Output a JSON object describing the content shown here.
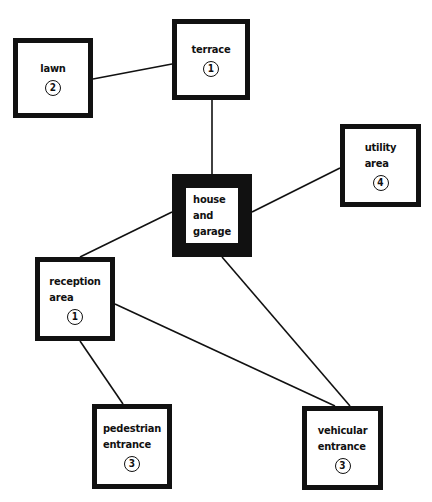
{
  "diagram": {
    "type": "bubble/adjacency diagram",
    "nodes": [
      {
        "id": "lawn",
        "label": [
          "lawn"
        ],
        "number": "2",
        "box": [
          13,
          38,
          80,
          80
        ],
        "border": 5
      },
      {
        "id": "terrace",
        "label": [
          "terrace"
        ],
        "number": "1",
        "box": [
          172,
          19,
          78,
          81
        ],
        "border": 5
      },
      {
        "id": "utility",
        "label": [
          "utility",
          "area"
        ],
        "number": "4",
        "box": [
          340,
          124,
          81,
          83
        ],
        "border": 5
      },
      {
        "id": "house",
        "label": [
          "house",
          "and",
          "garage"
        ],
        "number": null,
        "box": [
          172,
          174,
          80,
          83
        ],
        "border": 14
      },
      {
        "id": "reception",
        "label": [
          "reception",
          "area"
        ],
        "number": "1",
        "box": [
          35,
          257,
          80,
          84
        ],
        "border": 5
      },
      {
        "id": "pedestrian",
        "label": [
          "pedestrian",
          "entrance"
        ],
        "number": "3",
        "box": [
          92,
          404,
          80,
          85
        ],
        "border": 5
      },
      {
        "id": "vehicular",
        "label": [
          "vehicular",
          "entrance"
        ],
        "number": "3",
        "box": [
          302,
          406,
          81,
          84
        ],
        "border": 5
      }
    ],
    "edges": [
      {
        "from": "lawn",
        "to": "terrace",
        "line": [
          93,
          79,
          172,
          64
        ]
      },
      {
        "from": "terrace",
        "to": "house",
        "line": [
          212,
          100,
          212,
          174
        ]
      },
      {
        "from": "house",
        "to": "utility",
        "line": [
          252,
          212,
          340,
          168
        ]
      },
      {
        "from": "house",
        "to": "reception",
        "line": [
          172,
          212,
          80,
          257
        ]
      },
      {
        "from": "house",
        "to": "vehicular",
        "line": [
          222,
          257,
          350,
          406
        ]
      },
      {
        "from": "reception",
        "to": "vehicular",
        "line": [
          115,
          304,
          335,
          406
        ]
      },
      {
        "from": "reception",
        "to": "pedestrian",
        "line": [
          80,
          341,
          123,
          404
        ]
      }
    ],
    "colors": {
      "line": "#111111",
      "fill": "#ffffff"
    }
  }
}
